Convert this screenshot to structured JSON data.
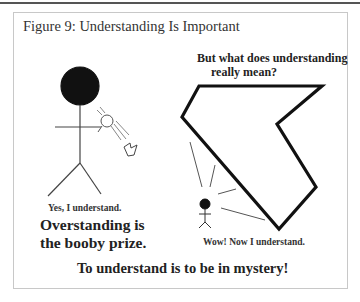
{
  "figure": {
    "title": "Figure 9: Understanding Is Important",
    "question_line1": "But what does understanding",
    "question_line2": "really mean?",
    "left_caption": "Yes, I understand.",
    "overstanding_line1": "Overstanding is",
    "overstanding_line2": "the booby prize.",
    "right_caption": "Wow! Now I understand.",
    "conclusion": "To understand is to be in mystery!"
  },
  "colors": {
    "ink": "#111111",
    "frame": "#c8c8c8",
    "background": "#ffffff"
  },
  "elements": {
    "left_figure": "large-headed stick figure holding a small light",
    "right_figure": "small stick figure facing a large irregular polygon"
  }
}
